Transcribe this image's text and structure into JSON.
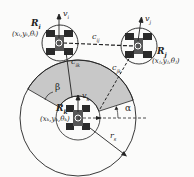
{
  "diagram": {
    "robots": [
      {
        "id": "R_i",
        "label": "R",
        "sub": "i",
        "pose": "(x",
        "pose_full": "(x_i,y_i,θ_i)",
        "velocity": "v_i"
      },
      {
        "id": "R_j",
        "label": "R",
        "sub": "j",
        "pose_full": "(x_j,y_j,θ_j)",
        "velocity": "v_j"
      },
      {
        "id": "R_k",
        "label": "R",
        "sub": "k",
        "pose_full": "(x_k,y_k,θ_k)",
        "velocity": "v_k"
      }
    ],
    "labels": {
      "ri_name": "R",
      "ri_sub": "i",
      "ri_pose": "(xᵢ,yᵢ,θᵢ)",
      "rj_name": "R",
      "rj_sub": "j",
      "rj_pose": "(xⱼ,yⱼ,θⱼ)",
      "rk_name": "R",
      "rk_sub": "k",
      "rk_pose": "(xₖ,yₖ,θₖ)",
      "vi": "v",
      "vi_sub": "i",
      "vj": "v",
      "vj_sub": "j",
      "vk": "v",
      "vk_sub": "k",
      "cij": "c",
      "cij_sub": "ij",
      "cik": "c",
      "cik_sub": "ik",
      "cjk": "c",
      "cjk_sub": "jk",
      "alpha": "α",
      "beta": "β",
      "rs": "r",
      "rs_sub": "s"
    },
    "colors": {
      "sector_fill": "#c8c8c8",
      "stroke": "#222222",
      "robot_body": "#2a2a2a"
    }
  }
}
